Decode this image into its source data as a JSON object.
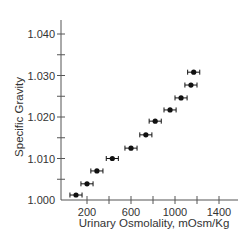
{
  "chart_data": {
    "type": "scatter",
    "title": "",
    "xlabel": "Urinary Osmolality, mOsm/Kg",
    "ylabel": "Specific Gravity",
    "xlim": [
      0,
      1550
    ],
    "ylim": [
      1.0,
      1.045
    ],
    "x_ticks": [
      200,
      400,
      600,
      800,
      1000,
      1200,
      1400
    ],
    "x_tick_labels": [
      "200",
      "600",
      "1000",
      "1400"
    ],
    "y_ticks": [
      1.0,
      1.005,
      1.01,
      1.015,
      1.02,
      1.025,
      1.03,
      1.035,
      1.04
    ],
    "y_tick_labels": [
      "1.000",
      "1.010",
      "1.020",
      "1.030",
      "1.040"
    ],
    "grid": false,
    "legend": null,
    "error_bars": "horizontal",
    "series": [
      {
        "name": "Specific Gravity vs Osmolality",
        "x": [
          100,
          200,
          290,
          430,
          600,
          735,
          820,
          955,
          1055,
          1145,
          1170
        ],
        "y": [
          1.0012,
          1.0039,
          1.007,
          1.01,
          1.0125,
          1.0157,
          1.019,
          1.0217,
          1.0246,
          1.0277,
          1.0308
        ],
        "x_err": [
          55,
          55,
          55,
          55,
          55,
          55,
          55,
          55,
          55,
          55,
          55
        ]
      }
    ]
  },
  "axes": {
    "x_title": "Urinary Osmolality, mOsm/Kg",
    "y_title": "Specific Gravity",
    "x_labels": [
      {
        "value": 200,
        "text": "200"
      },
      {
        "value": 600,
        "text": "600"
      },
      {
        "value": 1000,
        "text": "1000"
      },
      {
        "value": 1400,
        "text": "1400"
      }
    ],
    "y_labels": [
      {
        "value": 1.0,
        "text": "1.000"
      },
      {
        "value": 1.01,
        "text": "1.010"
      },
      {
        "value": 1.02,
        "text": "1.020"
      },
      {
        "value": 1.03,
        "text": "1.030"
      },
      {
        "value": 1.04,
        "text": "1.040"
      }
    ]
  },
  "colors": {
    "axis": "#555555",
    "marker": "#111111",
    "text": "#333333"
  }
}
